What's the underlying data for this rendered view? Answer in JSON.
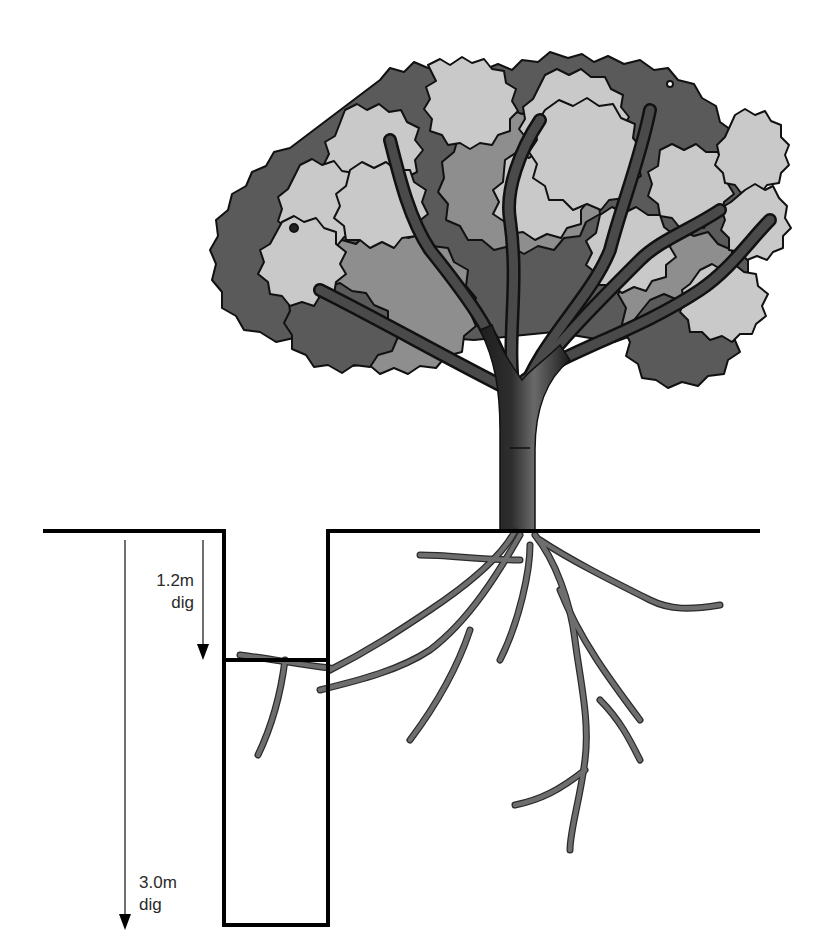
{
  "diagram": {
    "colors": {
      "line": "#000000",
      "root": "#6e6e6e",
      "root_outline": "#2b2b2b",
      "trunk_dark": "#1e1e1e",
      "trunk_mid": "#4a4a4a",
      "foliage_light": "#c9c9c9",
      "foliage_mid": "#8e8e8e",
      "foliage_dark": "#5a5a5a",
      "foliage_outline": "#111111",
      "text": "#2a2a2a"
    },
    "measurements": [
      {
        "value": "1.2m",
        "word": "dig"
      },
      {
        "value": "3.0m",
        "word": "dig"
      }
    ]
  }
}
